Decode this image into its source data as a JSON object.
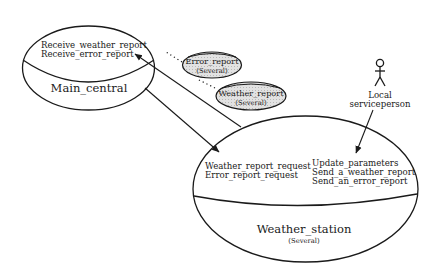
{
  "diagram": {
    "type": "object-interaction",
    "objects": [
      {
        "id": "main_central",
        "name": "Main_central",
        "multiplicity": "",
        "operations": [
          "Receive_weather_report",
          "Receive_error_report"
        ]
      },
      {
        "id": "weather_station",
        "name": "Weather_station",
        "multiplicity": "(Several)",
        "operations_left": [
          "Weather_report_request",
          "Error_report_request"
        ],
        "operations_right": [
          "Update_parameters",
          "Send_a_weather_report",
          "Send_an_error_report"
        ]
      }
    ],
    "messages": [
      {
        "id": "error_report",
        "name": "Error_report",
        "multiplicity": "(Several)"
      },
      {
        "id": "weather_report",
        "name": "Weather_report",
        "multiplicity": "(Several)"
      }
    ],
    "actor": {
      "line1": "Local",
      "line2": "serviceperson"
    },
    "edges": [
      {
        "from": "weather_station",
        "to": "main_central",
        "style": "solid-arrow"
      },
      {
        "from": "main_central",
        "to": "weather_station",
        "style": "solid-arrow"
      },
      {
        "from": "actor",
        "to": "weather_station",
        "style": "solid-arrow"
      },
      {
        "from": "error_report",
        "to": "edge-ws-to-main",
        "style": "dotted"
      },
      {
        "from": "weather_report",
        "to": "edge-ws-to-main",
        "style": "dotted"
      }
    ]
  },
  "colors": {
    "ink": "#1a1a1a",
    "message_fill": "#d9d9d9",
    "background": "#ffffff"
  }
}
